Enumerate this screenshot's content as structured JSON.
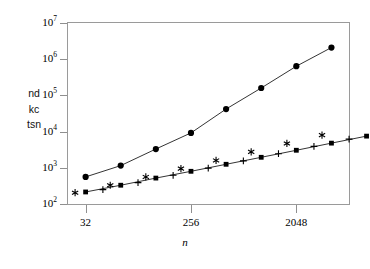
{
  "chart_data": {
    "type": "line",
    "title": "",
    "xlabel": "n",
    "ylabel_lines": [
      "nd",
      "kc",
      "tsn"
    ],
    "xscale": "log",
    "yscale": "log",
    "grid": false,
    "legend": "none",
    "xlim": [
      22.6,
      5792
    ],
    "ylim": [
      100,
      10000000
    ],
    "xticks": [
      32,
      256,
      2048
    ],
    "xtick_labels": [
      "32",
      "256",
      "2048"
    ],
    "yticks": [
      100,
      1000,
      10000,
      100000,
      1000000,
      10000000
    ],
    "ytick_labels": [
      "10",
      "10",
      "10",
      "10",
      "10",
      "10"
    ],
    "ytick_exponents": [
      "2",
      "3",
      "4",
      "5",
      "6",
      "7"
    ],
    "series": [
      {
        "name": "circles",
        "marker": "circle",
        "line": true,
        "color": "#000000",
        "x": [
          32,
          64,
          128,
          256,
          512,
          1024,
          2048,
          4096
        ],
        "y": [
          560,
          1150,
          3300,
          9200,
          42000,
          160000,
          640000,
          2100000
        ]
      },
      {
        "name": "squares",
        "marker": "square",
        "line": true,
        "color": "#000000",
        "x": [
          32,
          64,
          128,
          256,
          512,
          1024,
          2048,
          4096,
          8192
        ],
        "y": [
          215,
          330,
          520,
          800,
          1250,
          1950,
          3050,
          4800,
          7500
        ]
      },
      {
        "name": "plus",
        "marker": "plus",
        "line": false,
        "color": "#000000",
        "x": [
          45,
          90,
          180,
          360,
          720,
          1440,
          2900,
          5800
        ],
        "y": [
          250,
          390,
          620,
          980,
          1550,
          2450,
          3900,
          6200
        ]
      },
      {
        "name": "asterisk",
        "marker": "asterisk",
        "line": false,
        "color": "#000000",
        "x": [
          26,
          52,
          105,
          210,
          420,
          840,
          1700,
          3400
        ],
        "y": [
          205,
          330,
          560,
          950,
          1600,
          2750,
          4700,
          8000
        ]
      }
    ]
  },
  "axes": {
    "x_title": "n",
    "y_title_line1": "nd",
    "y_title_line2": "kc",
    "y_title_line3": "tsn"
  }
}
